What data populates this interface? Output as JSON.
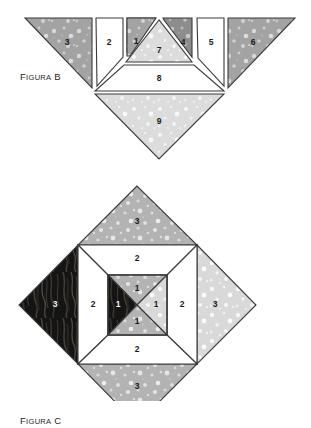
{
  "page": {
    "width": 311,
    "height": 401,
    "background": "#ffffff"
  },
  "figures": [
    {
      "id": "figura-b",
      "caption_first": "F",
      "caption_rest": "IGURA",
      "caption_tail": " B",
      "caption_full": "Figura B",
      "description": "Exploded tangram-like set of nine numbered polygon pieces arranged in a row with two pieces below",
      "pieces": [
        {
          "label": "3",
          "fill": "speckled-dark-gray"
        },
        {
          "label": "2",
          "fill": "white"
        },
        {
          "label": "1",
          "fill": "speckled-dark-gray"
        },
        {
          "label": "7",
          "fill": "speckled-light-gray"
        },
        {
          "label": "4",
          "fill": "speckled-darker-gray"
        },
        {
          "label": "5",
          "fill": "white"
        },
        {
          "label": "6",
          "fill": "speckled-dark-gray"
        },
        {
          "label": "8",
          "fill": "white"
        },
        {
          "label": "9",
          "fill": "speckled-light-gray"
        }
      ]
    },
    {
      "id": "figura-c",
      "caption_first": "F",
      "caption_rest": "IGURA",
      "caption_tail": " C",
      "caption_full": "Figura C",
      "description": "Assembled diamond (square rotated 45 degrees) with three concentric rings of numbered pieces",
      "pieces": [
        {
          "label": "3",
          "position": "outer-top",
          "fill": "speckled-mid-gray"
        },
        {
          "label": "3",
          "position": "outer-left",
          "fill": "dark-flame-texture"
        },
        {
          "label": "3",
          "position": "outer-right",
          "fill": "speckled-light-gray"
        },
        {
          "label": "3",
          "position": "outer-bottom",
          "fill": "speckled-mid-gray"
        },
        {
          "label": "2",
          "position": "middle-top",
          "fill": "white"
        },
        {
          "label": "2",
          "position": "middle-left",
          "fill": "white"
        },
        {
          "label": "2",
          "position": "middle-right",
          "fill": "white"
        },
        {
          "label": "2",
          "position": "middle-bottom",
          "fill": "white"
        },
        {
          "label": "1",
          "position": "inner-top",
          "fill": "speckled-mid-gray"
        },
        {
          "label": "1",
          "position": "inner-left",
          "fill": "dark-flame-texture"
        },
        {
          "label": "1",
          "position": "inner-right",
          "fill": "speckled-light-gray"
        },
        {
          "label": "1",
          "position": "inner-bottom",
          "fill": "speckled-mid-gray"
        }
      ]
    }
  ],
  "colors": {
    "stroke": "#3a3a3a",
    "white_fill": "#ffffff",
    "speckled_light_gray": "#d6d6d6",
    "speckled_mid_gray": "#b4b4b4",
    "speckled_dark_gray": "#a5a5a5",
    "speckled_darker_gray": "#8f8f8f",
    "dark_texture": "#1c1c1c",
    "text": "#231f20"
  }
}
